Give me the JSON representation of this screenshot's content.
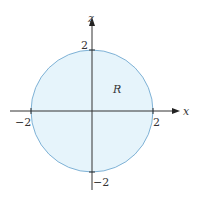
{
  "diagram": {
    "x_axis_label": "x",
    "z_axis_label": "z",
    "region_label": "R",
    "ticks": {
      "x_neg": "−2",
      "x_pos": "2",
      "z_pos": "2",
      "z_neg": "−2"
    },
    "colors": {
      "fill": "#e6f4fb",
      "circle_stroke": "#7fb2d6",
      "axis": "#333333"
    },
    "circle": {
      "radius": 2,
      "center": [
        0,
        0
      ]
    }
  }
}
